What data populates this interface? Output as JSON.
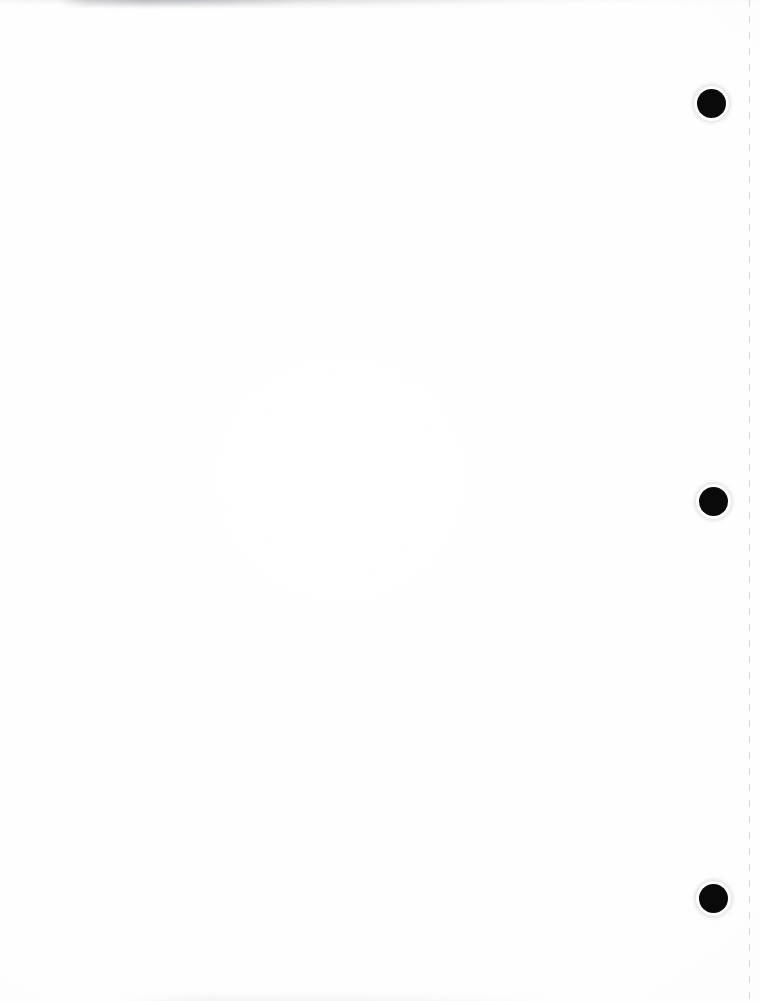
{
  "document": {
    "kind": "scanned-page",
    "caption": "Blank scanned document page",
    "page_width": 760,
    "page_height": 1001,
    "background_color": "#ffffff",
    "paper_tone": "#fdfdfd",
    "visible_text": ""
  },
  "marks": {
    "ink_color": "#0a0a0a",
    "punch_marks": [
      {
        "name": "punch-mark-top",
        "cx": 711,
        "cy": 103,
        "d": 29
      },
      {
        "name": "punch-mark-middle",
        "cx": 713,
        "cy": 501,
        "d": 29
      },
      {
        "name": "punch-mark-bottom",
        "cx": 713,
        "cy": 898,
        "d": 29
      }
    ]
  },
  "fold_line": {
    "name": "right-margin-dashed-line",
    "x": 749,
    "color": "#d8d8dc",
    "thickness": 1,
    "dash": "7px 9px"
  },
  "artifacts": {
    "top_band_label": "",
    "bottom_band_label": ""
  }
}
